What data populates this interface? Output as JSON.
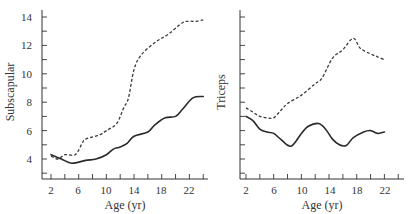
{
  "chart_data": [
    {
      "type": "line",
      "title": "",
      "xlabel": "Age (yr)",
      "ylabel": "Subscapular",
      "xlim": [
        1,
        25
      ],
      "ylim": [
        3,
        14.5
      ],
      "xticks": [
        2,
        6,
        10,
        14,
        18,
        22
      ],
      "yticks": [
        4,
        6,
        8,
        10,
        12,
        14
      ],
      "grid": false,
      "series": [
        {
          "name": "dashed",
          "style": "dashed",
          "x": [
            2,
            3,
            4,
            5.5,
            6.5,
            7,
            9,
            10,
            11.5,
            12.5,
            13.2,
            14,
            15,
            17,
            19,
            21,
            22,
            23,
            24
          ],
          "y": [
            4.2,
            4.0,
            4.3,
            4.3,
            5.1,
            5.4,
            5.7,
            6.0,
            6.5,
            7.6,
            8.3,
            10.3,
            11.3,
            12.2,
            12.8,
            13.6,
            13.7,
            13.7,
            13.8
          ]
        },
        {
          "name": "solid",
          "style": "solid",
          "x": [
            2,
            3.5,
            5,
            7,
            8.5,
            10,
            11,
            12,
            13,
            14,
            16,
            17,
            18.5,
            20,
            21,
            22.5,
            24
          ],
          "y": [
            4.3,
            4.0,
            3.7,
            3.9,
            4.0,
            4.3,
            4.7,
            4.85,
            5.1,
            5.6,
            5.9,
            6.4,
            6.9,
            7.0,
            7.5,
            8.3,
            8.4
          ]
        }
      ]
    },
    {
      "type": "line",
      "title": "",
      "xlabel": "Age (yr)",
      "ylabel": "Triceps",
      "xlim": [
        1,
        25
      ],
      "ylim": [
        3,
        14.5
      ],
      "xticks": [
        2,
        6,
        10,
        14,
        18,
        22
      ],
      "yticks": [],
      "grid": false,
      "series": [
        {
          "name": "dashed",
          "style": "dashed",
          "x": [
            2,
            3,
            4,
            5,
            6,
            7,
            8,
            10,
            12,
            13,
            14.5,
            16,
            17.5,
            18.5,
            20,
            21,
            22
          ],
          "y": [
            7.6,
            7.3,
            7.0,
            6.9,
            6.9,
            7.4,
            7.9,
            8.5,
            9.3,
            9.7,
            11.1,
            11.7,
            12.5,
            11.8,
            11.4,
            11.2,
            11.0
          ]
        },
        {
          "name": "solid",
          "style": "solid",
          "x": [
            2,
            3,
            4,
            5,
            6,
            7,
            8.5,
            10,
            11,
            12.5,
            13.5,
            14.5,
            15.5,
            16.5,
            17.5,
            19,
            20,
            21,
            22
          ],
          "y": [
            7.0,
            6.7,
            6.1,
            5.9,
            5.8,
            5.4,
            4.9,
            5.8,
            6.3,
            6.5,
            6.1,
            5.4,
            5.0,
            4.95,
            5.5,
            5.9,
            6.0,
            5.8,
            5.9
          ]
        }
      ]
    }
  ],
  "labels": {
    "left_ylabel": "Subscapular",
    "right_ylabel": "Triceps",
    "left_xlabel": "Age (yr)",
    "right_xlabel": "Age (yr)",
    "left_yticks": [
      "4",
      "6",
      "8",
      "10",
      "12",
      "14"
    ],
    "left_xticks": [
      "2",
      "6",
      "10",
      "14",
      "18",
      "22"
    ],
    "right_xticks": [
      "2",
      "6",
      "10",
      "14",
      "18",
      "22"
    ]
  }
}
